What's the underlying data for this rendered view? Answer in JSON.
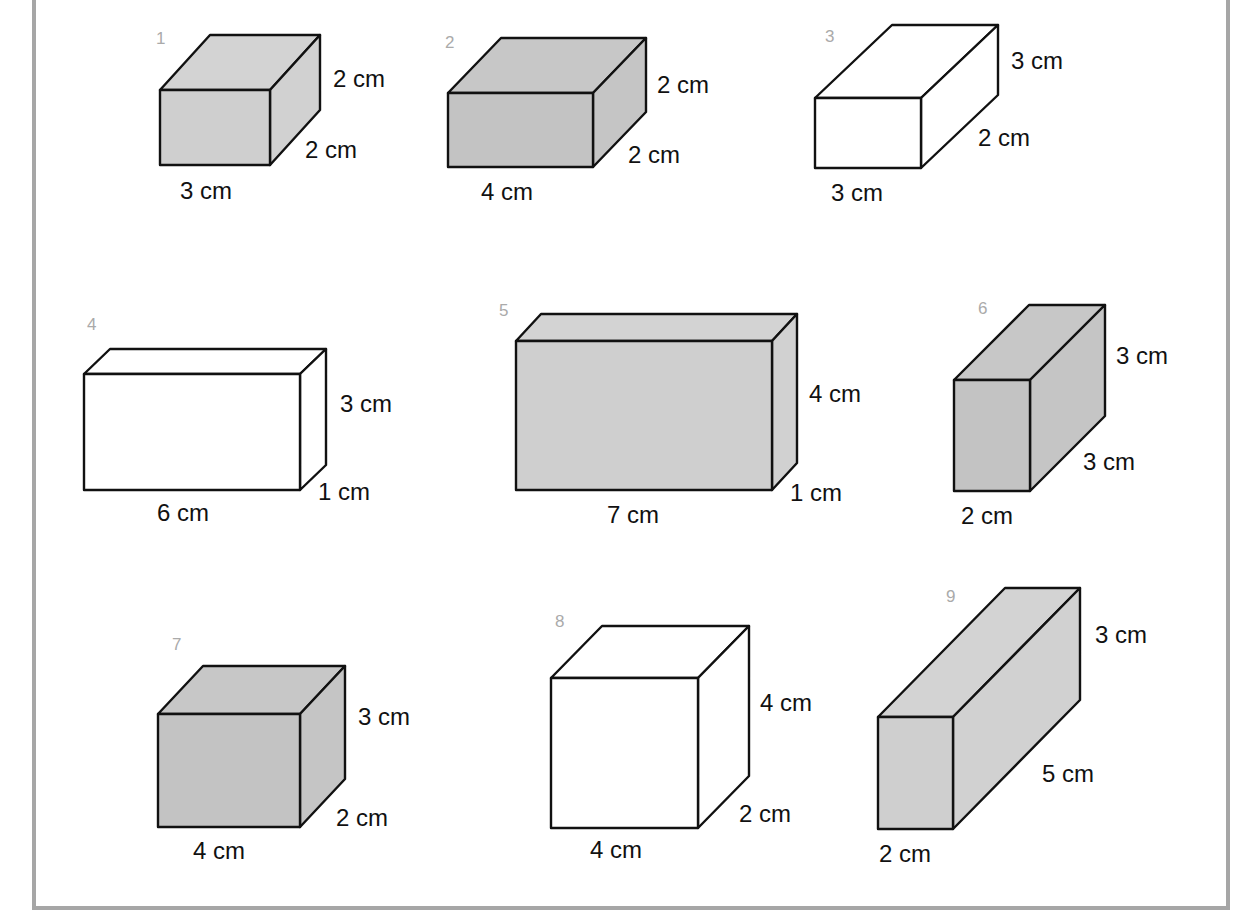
{
  "colors": {
    "frame": "#a6a6a6",
    "light_gray": "#cfcfcf",
    "mid_gray": "#c3c3c3",
    "white": "#ffffff",
    "edge": "#111111",
    "number": "#aaaaaa"
  },
  "boxes": [
    {
      "number": "1",
      "fill": "light",
      "width_label": "3 cm",
      "height_label": "2 cm",
      "depth_label": "2 cm",
      "front": [
        160,
        90,
        270,
        165
      ],
      "depth": [
        50,
        -55
      ]
    },
    {
      "number": "2",
      "fill": "mid",
      "width_label": "4 cm",
      "height_label": "2 cm",
      "depth_label": "2 cm",
      "front": [
        448,
        93,
        593,
        167
      ],
      "depth": [
        53,
        -55
      ]
    },
    {
      "number": "3",
      "fill": "white",
      "width_label": "3 cm",
      "height_label": "3 cm",
      "depth_label": "2 cm",
      "front": [
        815,
        98,
        921,
        168
      ],
      "depth": [
        77,
        -73
      ]
    },
    {
      "number": "4",
      "fill": "white",
      "width_label": "6 cm",
      "height_label": "3 cm",
      "depth_label": "1 cm",
      "front": [
        84,
        374,
        300,
        490
      ],
      "depth": [
        26,
        -25
      ]
    },
    {
      "number": "5",
      "fill": "light",
      "width_label": "7 cm",
      "height_label": "4 cm",
      "depth_label": "1 cm",
      "front": [
        516,
        341,
        772,
        490
      ],
      "depth": [
        25,
        -27
      ]
    },
    {
      "number": "6",
      "fill": "mid",
      "width_label": "2 cm",
      "height_label": "3 cm",
      "depth_label": "3 cm",
      "front": [
        954,
        380,
        1030,
        491
      ],
      "depth": [
        75,
        -75
      ]
    },
    {
      "number": "7",
      "fill": "mid",
      "width_label": "4 cm",
      "height_label": "3 cm",
      "depth_label": "2 cm",
      "front": [
        158,
        714,
        300,
        827
      ],
      "depth": [
        45,
        -48
      ]
    },
    {
      "number": "8",
      "fill": "white",
      "width_label": "4 cm",
      "height_label": "4 cm",
      "depth_label": "2 cm",
      "front": [
        551,
        678,
        698,
        828
      ],
      "depth": [
        51,
        -52
      ]
    },
    {
      "number": "9",
      "fill": "light",
      "width_label": "2 cm",
      "height_label": "3 cm",
      "depth_label": "5 cm",
      "front": [
        878,
        717,
        953,
        829
      ],
      "depth": [
        127,
        -129
      ]
    }
  ],
  "label_positions": [
    {
      "num": [
        156,
        44
      ],
      "w": [
        180,
        199
      ],
      "h": [
        333,
        87
      ],
      "d": [
        305,
        158
      ]
    },
    {
      "num": [
        445,
        48
      ],
      "w": [
        481,
        200
      ],
      "h": [
        657,
        93
      ],
      "d": [
        628,
        163
      ]
    },
    {
      "num": [
        825,
        42
      ],
      "w": [
        831,
        201
      ],
      "h": [
        1011,
        69
      ],
      "d": [
        978,
        146
      ]
    },
    {
      "num": [
        87,
        330
      ],
      "w": [
        157,
        521
      ],
      "h": [
        340,
        412
      ],
      "d": [
        318,
        500
      ]
    },
    {
      "num": [
        499,
        316
      ],
      "w": [
        607,
        523
      ],
      "h": [
        809,
        402
      ],
      "d": [
        790,
        501
      ]
    },
    {
      "num": [
        978,
        314
      ],
      "w": [
        961,
        524
      ],
      "h": [
        1116,
        364
      ],
      "d": [
        1083,
        470
      ]
    },
    {
      "num": [
        172,
        650
      ],
      "w": [
        193,
        859
      ],
      "h": [
        358,
        725
      ],
      "d": [
        336,
        826
      ]
    },
    {
      "num": [
        555,
        627
      ],
      "w": [
        590,
        858
      ],
      "h": [
        760,
        711
      ],
      "d": [
        739,
        822
      ]
    },
    {
      "num": [
        946,
        602
      ],
      "w": [
        879,
        862
      ],
      "h": [
        1095,
        643
      ],
      "d": [
        1042,
        782
      ]
    }
  ]
}
